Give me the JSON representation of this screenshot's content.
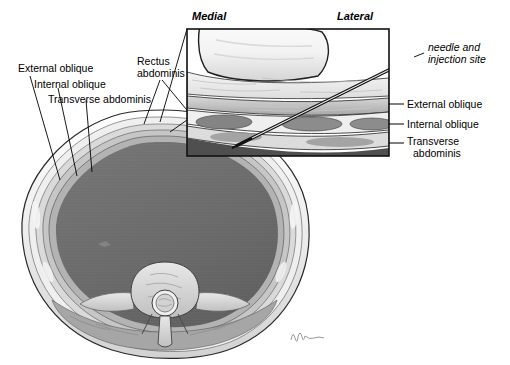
{
  "figure": {
    "type": "medical-illustration",
    "signature": "artist-signature"
  },
  "main_view": {
    "name": "axial-abdominal-cross-section",
    "labels_left": [
      {
        "text": "External oblique"
      },
      {
        "text": "Internal oblique"
      },
      {
        "text": "Transverse abdominis"
      }
    ],
    "label_rectus": {
      "line1": "Rectus",
      "line2": "abdominis"
    },
    "structures": [
      "skin",
      "subcutaneous-fat",
      "external-oblique-muscle",
      "internal-oblique-muscle",
      "transverse-abdominis-muscle",
      "peritoneal-cavity",
      "vertebral-body",
      "spinal-canal",
      "spinal-cord",
      "transverse-process",
      "spinous-process",
      "paraspinal-muscle"
    ]
  },
  "inset": {
    "name": "magnified-abdominal-wall-inset",
    "orientation_left": "Medial",
    "orientation_right": "Lateral",
    "needle_label": {
      "line1": "needle and",
      "line2": "injection site"
    },
    "labels_right": [
      {
        "text": "External oblique"
      },
      {
        "text": "Internal oblique"
      },
      {
        "line1": "Transverse",
        "line2": "abdominis"
      }
    ],
    "layers": [
      "rectus-abdominis",
      "subcutaneous-fat",
      "external-oblique",
      "internal-oblique",
      "transverse-abdominis",
      "peritoneum"
    ]
  },
  "colors": {
    "background": "#ffffff",
    "outline": "#1a1a1a",
    "cavity_dark": "#6e6e6e",
    "muscle_mid": "#9a9a9a",
    "fat_light": "#dcdcdc",
    "fascia_pale": "#f0f0f0",
    "bone_light": "#c8c8c8",
    "inset_border": "#111111",
    "leader_line": "#000000"
  }
}
